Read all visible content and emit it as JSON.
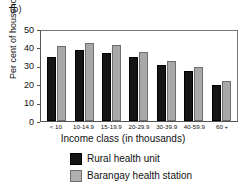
{
  "panel": {
    "label": "(b)"
  },
  "chart_data": {
    "type": "bar",
    "title": "",
    "xlabel": "Income class (in thousands)",
    "ylabel": "Per cent of households",
    "categories": [
      "< 10",
      "10-14.9",
      "15-19.9",
      "20-29.9",
      "30-39.9",
      "40-59.9",
      "60 +"
    ],
    "series": [
      {
        "name": "Rural health unit",
        "color": "#141414",
        "values": [
          34.8,
          38.8,
          37.0,
          34.8,
          30.4,
          27.2,
          19.6
        ]
      },
      {
        "name": "Barangay health station",
        "color": "#a8a8a8",
        "values": [
          40.6,
          42.4,
          41.5,
          37.7,
          32.7,
          29.3,
          21.9
        ]
      }
    ],
    "ylim": [
      0,
      50
    ],
    "yticks": [
      0,
      10,
      20,
      30,
      40,
      50
    ],
    "ytick_labels": [
      "0",
      "10",
      "20",
      "30",
      "40",
      "50"
    ],
    "grid": false,
    "legend_position": "bottom-center"
  }
}
